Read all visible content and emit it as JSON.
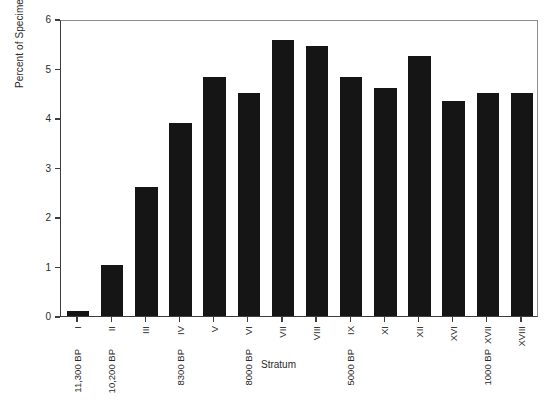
{
  "chart_data": {
    "type": "bar",
    "title": "",
    "xlabel": "Stratum",
    "ylabel": "Percent of Specimens per Stratum",
    "categories": [
      "I",
      "II",
      "III",
      "IV",
      "V",
      "VI",
      "VII",
      "VIII",
      "IX",
      "XI",
      "XII",
      "XVI",
      "XVII",
      "XVIII"
    ],
    "values": [
      0.1,
      1.03,
      2.6,
      3.9,
      4.82,
      4.5,
      5.58,
      5.45,
      4.82,
      4.6,
      5.25,
      4.35,
      4.5,
      4.5
    ],
    "secondary_labels": [
      "11,300 BP",
      "10,200 BP",
      "",
      "8300 BP",
      "",
      "8000 BP",
      "",
      "",
      "5000 BP",
      "",
      "",
      "",
      "1000 BP",
      ""
    ],
    "ylim": [
      0,
      6
    ],
    "yticks": [
      "0",
      "1",
      "2",
      "3",
      "4",
      "5",
      "6"
    ],
    "grid": false,
    "legend": false,
    "bar_color": "#151515",
    "axis_color": "#3d3d3d"
  },
  "axes": {
    "y_title": "Percent of Specimens per Stratum",
    "x_title": "Stratum"
  }
}
